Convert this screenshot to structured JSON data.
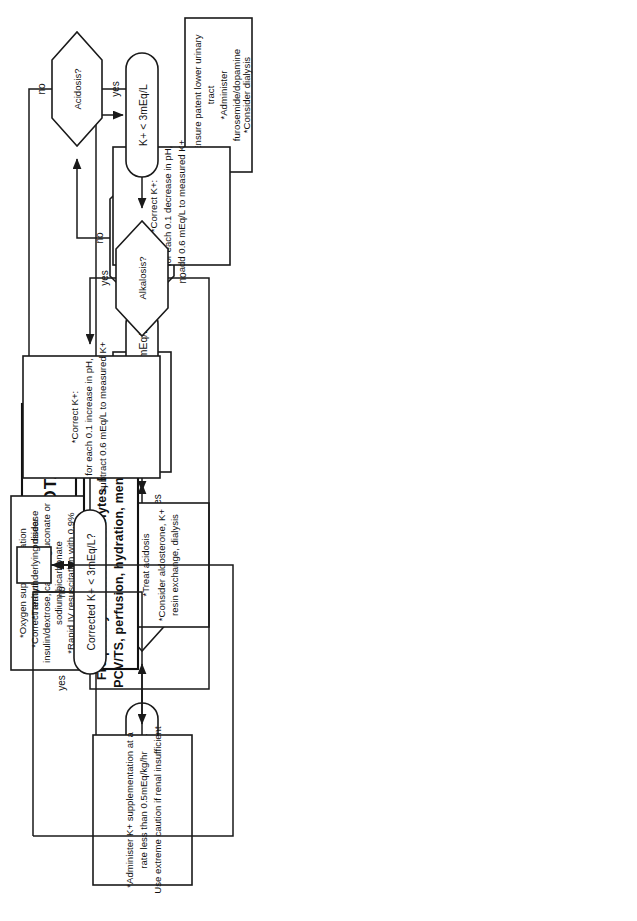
{
  "diagram": {
    "title": "POTASSIUM",
    "type": "clinical-decision-flowchart",
    "orientation": "rotated-90-counterclockwise"
  },
  "nodes": {
    "root": {
      "id": "potassium",
      "shape": "rect-bold",
      "label": "POTASSIUM"
    },
    "hyper_branch": {
      "terminal": {
        "id": "k-high",
        "shape": "stadium",
        "label": "K+ > 5.5mEq/L"
      },
      "perfusion": {
        "id": "perfusion",
        "shape": "diamond",
        "line1": "Is perfusion",
        "line2": "adequate?"
      },
      "resus": {
        "id": "resuscitate",
        "shape": "rect",
        "lines": [
          "*Oxygen supplementation",
          "*Correct arrhythmias: consider",
          "insulin/dextrose, calcium gluconate or",
          "sodium bicarbonate",
          "*Rapid IV resuscitation with 0.9%",
          "saline and synthetic colloids"
        ]
      },
      "diuresis": {
        "id": "promote-diuresis",
        "shape": "rect",
        "line1": "*Promote diuresis",
        "line2": "with 0.9% saline"
      },
      "renal_failure": {
        "id": "low-output-renal-failure",
        "shape": "diamond",
        "line1": "Low output renal",
        "line2": "failure?"
      },
      "urinary": {
        "id": "patent-urinary-tract",
        "shape": "rect",
        "lines": [
          "*Ensure patent lower urinary",
          "tract",
          "*Administer",
          "furosemide/dopamine",
          "*Consider dialysis"
        ]
      },
      "acidosis": {
        "id": "acidosis",
        "shape": "diamond",
        "label": "Acidosis?"
      },
      "correct_acid": {
        "id": "correct-k-acidosis",
        "shape": "rect",
        "lines": [
          "*Correct  K+:",
          "for each 0.1 decrease in pH,",
          "add 0.6 mEq/L to measured K+"
        ]
      },
      "corrected_high": {
        "id": "corrected-k-high",
        "shape": "stadium",
        "label": "Corrected K+ > 5.5mEq/L?"
      },
      "treat_acidosis": {
        "id": "treat-acidosis",
        "shape": "rect",
        "lines": [
          "*Treat  acidosis",
          "*Consider aldosterone, K+",
          "resin exchange, dialysis"
        ]
      }
    },
    "hypo_branch": {
      "terminal": {
        "id": "k-low",
        "shape": "stadium",
        "label": "K+ < 3mEq/L"
      },
      "alkalosis": {
        "id": "alkalosis",
        "shape": "diamond",
        "label": "Alkalosis?"
      },
      "correct_alk": {
        "id": "correct-k-alkalosis",
        "shape": "rect",
        "lines": [
          "*Correct  K+:",
          "for each 0.1 increase in pH,",
          "subtract 0.6 mEq/L to measured K+"
        ]
      },
      "corrected_low": {
        "id": "corrected-k-low",
        "shape": "stadium",
        "label": "Corrected K+ < 3mEq/L?"
      },
      "administer": {
        "id": "administer-k",
        "shape": "rect",
        "lines": [
          "*Administer K+ supplementation at a",
          "rate less than 0.5mEq/kg/hr",
          "Use extreme caution if renal insufficient"
        ]
      }
    },
    "shared": {
      "treat_underlying": {
        "id": "treat-underlying-disease",
        "shape": "rect",
        "label": "*Treat underlying disease"
      },
      "monitor": {
        "id": "frequently-monitor",
        "shape": "rect-bold",
        "line1": "Frequently monitor  electrolytes,  ECG,",
        "line2": "PCV/TS, perfusion, hydration, mentation"
      }
    }
  },
  "edge_labels": {
    "perfusion_no": "no",
    "perfusion_yes": "yes",
    "renal_failure_no": "no",
    "renal_failure_yes": "yes",
    "acidosis_no": "no",
    "acidosis_yes": "yes",
    "corrected_high_no": "no",
    "corrected_high_yes": "yes",
    "alkalosis_yes": "yes",
    "alkalosis_no": "no",
    "corrected_low_no": "no",
    "corrected_low_yes": "yes"
  },
  "colors": {
    "stroke": "#1a1a1a",
    "text": "#111111",
    "background": "#ffffff"
  }
}
